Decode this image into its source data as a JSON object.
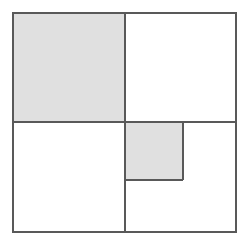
{
  "figure": {
    "canvas": {
      "width": 248,
      "height": 245,
      "background": "#ffffff"
    },
    "style": {
      "stroke_color": "#595959",
      "stroke_width": 1.6,
      "shaded_fill": "#e0e0e0",
      "unshaded_fill": "#ffffff"
    },
    "outer_square": {
      "name": "outer-square",
      "x": 13,
      "y": 13,
      "width": 223,
      "height": 219,
      "shaded": false
    },
    "midlines": {
      "vertical_x": 125,
      "horizontal_y": 122
    },
    "regions": [
      {
        "id": "top-left-quadrant",
        "label": "Top-left quadrant",
        "x": 13,
        "y": 13,
        "width": 112,
        "height": 109,
        "shaded": true
      },
      {
        "id": "top-right-quadrant",
        "label": "Top-right quadrant",
        "x": 125,
        "y": 13,
        "width": 111,
        "height": 109,
        "shaded": false
      },
      {
        "id": "bottom-left-quadrant",
        "label": "Bottom-left quadrant",
        "x": 13,
        "y": 122,
        "width": 112,
        "height": 110,
        "shaded": false
      },
      {
        "id": "bottom-right-quadrant",
        "label": "Bottom-right quadrant",
        "x": 125,
        "y": 122,
        "width": 111,
        "height": 110,
        "shaded": false
      },
      {
        "id": "inner-shaded-square",
        "label": "Inner shaded square",
        "x": 125,
        "y": 122,
        "width": 58,
        "height": 58,
        "shaded": true
      }
    ],
    "shaded_region_count": 2,
    "total_region_count": 5
  }
}
